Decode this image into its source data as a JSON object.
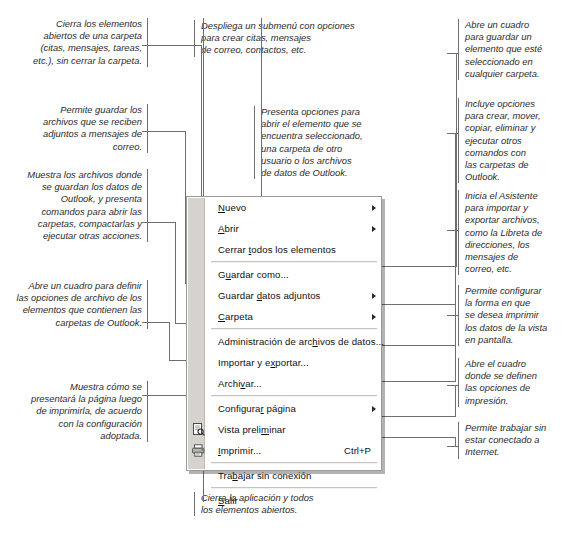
{
  "figure": {
    "accent_color": "#6f6f6f",
    "menu_background": "#ffffff",
    "menu_gutter_color": "#d6d3ce",
    "menu_border_color": "#9a9a9a"
  },
  "menu": {
    "items": [
      {
        "id": "nuevo",
        "label_pre": "",
        "accel": "N",
        "label_post": "uevo",
        "shortcut": "",
        "submenu": true,
        "icon": ""
      },
      {
        "id": "abrir",
        "label_pre": "",
        "accel": "A",
        "label_post": "brir",
        "shortcut": "",
        "submenu": true,
        "icon": ""
      },
      {
        "id": "cerrar-todos",
        "label_pre": "Cerrar ",
        "accel": "t",
        "label_post": "odos los elementos",
        "shortcut": "",
        "submenu": false,
        "icon": ""
      },
      {
        "id": "separator-1",
        "separator": true
      },
      {
        "id": "guardar-como",
        "label_pre": "G",
        "accel": "u",
        "label_post": "ardar como...",
        "shortcut": "",
        "submenu": false,
        "icon": ""
      },
      {
        "id": "guardar-datos-adjuntos",
        "label_pre": "Guardar ",
        "accel": "d",
        "label_post": "atos adjuntos",
        "shortcut": "",
        "submenu": true,
        "icon": ""
      },
      {
        "id": "carpeta",
        "label_pre": "",
        "accel": "C",
        "label_post": "arpeta",
        "shortcut": "",
        "submenu": true,
        "icon": ""
      },
      {
        "id": "separator-2",
        "separator": true
      },
      {
        "id": "administracion-archivos-datos",
        "label_pre": "Administración de arc",
        "accel": "h",
        "label_post": "ivos de datos...",
        "shortcut": "",
        "submenu": false,
        "icon": ""
      },
      {
        "id": "importar-exportar",
        "label_pre": "Importar y e",
        "accel": "x",
        "label_post": "portar...",
        "shortcut": "",
        "submenu": false,
        "icon": ""
      },
      {
        "id": "archivar",
        "label_pre": "Archi",
        "accel": "v",
        "label_post": "ar...",
        "shortcut": "",
        "submenu": false,
        "icon": ""
      },
      {
        "id": "separator-3",
        "separator": true
      },
      {
        "id": "configurar-pagina",
        "label_pre": "Configura",
        "accel": "r",
        "label_post": " página",
        "shortcut": "",
        "submenu": true,
        "icon": ""
      },
      {
        "id": "vista-preliminar",
        "label_pre": "Vista preli",
        "accel": "m",
        "label_post": "inar",
        "shortcut": "",
        "submenu": false,
        "icon": "print-preview-icon"
      },
      {
        "id": "imprimir",
        "label_pre": "",
        "accel": "I",
        "label_post": "mprimir...",
        "shortcut": "Ctrl+P",
        "submenu": false,
        "icon": "printer-icon"
      },
      {
        "id": "separator-4",
        "separator": true
      },
      {
        "id": "trabajar-sin-conexion",
        "label_pre": "Tra",
        "accel": "b",
        "label_post": "ajar sin conexión",
        "shortcut": "",
        "submenu": false,
        "icon": ""
      },
      {
        "id": "separator-5",
        "separator": true
      },
      {
        "id": "salir",
        "label_pre": "",
        "accel": "S",
        "label_post": "alir",
        "shortcut": "",
        "submenu": false,
        "icon": ""
      }
    ]
  },
  "annotations": {
    "left": [
      {
        "id": "note-cerrar-todos",
        "text": "Cierra los elementos abiertos de una carpeta (citas, mensajes, tareas, etc.), sin cerrar la carpeta."
      },
      {
        "id": "note-guardar-datos-adjuntos",
        "text": "Permite guardar los archivos que se reciben adjuntos a mensajes de correo."
      },
      {
        "id": "note-administracion-archivos-datos",
        "text": "Muestra los archivos donde se guardan los datos de Outlook, y presenta comandos para abrir las carpetas, compactarlas y ejecutar otras acciones."
      },
      {
        "id": "note-archivar",
        "text": "Abre un cuadro para definir las opciones de archivo de los elementos que contienen las carpetas de Outlook."
      },
      {
        "id": "note-vista-preliminar",
        "text": "Muestra cómo se presentará la página luego de imprimirla, de acuerdo con la configuración adoptada."
      }
    ],
    "center": [
      {
        "id": "note-nuevo",
        "text": "Despliega un submenú con opciones\npara crear citas, mensajes\nde correo, contactos, etc."
      },
      {
        "id": "note-abrir",
        "text": "Presenta opciones para\nabrir el elemento que se\nencuentra seleccionado,\nuna carpeta de otro\nusuario o los archivos\nde datos de Outlook."
      }
    ],
    "right": [
      {
        "id": "note-guardar-como",
        "text": "Abre un cuadro\npara guardar un\nelemento que esté\nseleccionado en\ncualquier carpeta."
      },
      {
        "id": "note-carpeta",
        "text": "Incluye opciones\npara crear, mover,\ncopiar, eliminar y\nejecutar otros\ncomandos con\nlas carpetas de\nOutlook."
      },
      {
        "id": "note-importar-exportar",
        "text": "Inicia el Asistente\npara importar y\nexportar archivos,\ncomo la Libreta de\ndirecciones, los\nmensajes de\ncorreo, etc."
      },
      {
        "id": "note-configurar-pagina",
        "text": "Permite configurar\nla forma en que\nse desea imprimir\nlos datos de la vista\nen pantalla."
      },
      {
        "id": "note-imprimir",
        "text": "Abre el cuadro\ndonde se definen\nlas opciones de\nimpresión."
      },
      {
        "id": "note-trabajar-sin-conexion",
        "text": "Permite trabajar sin\nestar conectado a\nInternet."
      }
    ],
    "bottom": [
      {
        "id": "note-salir",
        "text": "Cierra la aplicación y todos\nlos elementos abiertos."
      }
    ]
  }
}
